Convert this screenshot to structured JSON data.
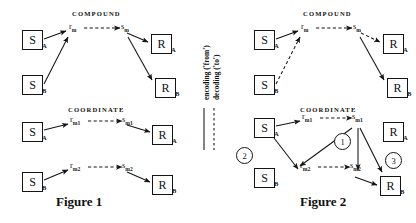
{
  "figures": [
    {
      "id": "figure-1",
      "caption": "Figure 1",
      "sections": [
        {
          "id": "compound",
          "label": "COMPOUND"
        },
        {
          "id": "coordinate",
          "label": "COORDINATE"
        }
      ],
      "nodes": {
        "s_a_top": "S",
        "s_a_top_sub": "A",
        "s_b_top": "S",
        "s_b_top_sub": "B",
        "r_a_top": "R",
        "r_a_top_sub": "A",
        "r_b_top": "R",
        "r_b_top_sub": "B",
        "rm": "r",
        "rm_sub": "m",
        "sm": "s",
        "sm_sub": "m",
        "s_a_c1": "S",
        "s_a_c1_sub": "A",
        "r_a_c1": "R",
        "r_a_c1_sub": "A",
        "rm1": "r",
        "rm1_sub": "m1",
        "sm1": "s",
        "sm1_sub": "m1",
        "s_b_c2": "S",
        "s_b_c2_sub": "B",
        "r_b_c2": "R",
        "r_b_c2_sub": "B",
        "rm2": "r",
        "rm2_sub": "m2",
        "sm2": "s",
        "sm2_sub": "m2"
      }
    },
    {
      "id": "figure-2",
      "caption": "Figure 2",
      "sections": [
        {
          "id": "compound",
          "label": "COMPOUND"
        },
        {
          "id": "coordinate",
          "label": "COORDINATE"
        }
      ],
      "nodes": {
        "s_a_top": "S",
        "s_a_top_sub": "A",
        "s_b_top": "S",
        "s_b_top_sub": "B",
        "r_a_top": "R",
        "r_a_top_sub": "A",
        "r_b_top": "R",
        "r_b_top_sub": "B",
        "rm": "r",
        "rm_sub": "m",
        "sm": "s",
        "sm_sub": "m",
        "s_a_c": "S",
        "s_a_c_sub": "A",
        "s_b_c": "S",
        "s_b_c_sub": "B",
        "r_a_c": "R",
        "r_a_c_sub": "A",
        "r_b_c": "R",
        "r_b_c_sub": "B",
        "rm1": "r",
        "rm1_sub": "m1",
        "sm1": "s",
        "sm1_sub": "m1",
        "rm2": "r",
        "rm2_sub": "m2",
        "sm2": "s",
        "sm2_sub": "m2"
      },
      "markers": [
        {
          "id": "marker-1",
          "label": "1"
        },
        {
          "id": "marker-2",
          "label": "2"
        },
        {
          "id": "marker-3",
          "label": "3"
        }
      ]
    }
  ],
  "legend": {
    "encoding_label": "encoding ('from')",
    "decoding_label": "decoding ('to')"
  },
  "colors": {
    "ink": "#141414",
    "background": "#ffffff"
  }
}
